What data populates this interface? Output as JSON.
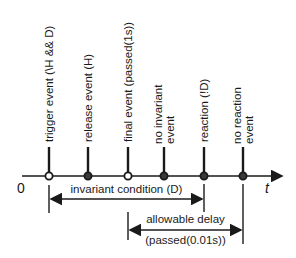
{
  "diagram": {
    "axis": {
      "origin_label": "0",
      "end_label": "t"
    },
    "events": [
      {
        "label_lines": [
          "trigger event (\\H && D)"
        ],
        "x": 49,
        "marker": "hollow"
      },
      {
        "label_lines": [
          "release event (H)"
        ],
        "x": 88,
        "marker": "filled"
      },
      {
        "label_lines": [
          "final event (passed(1s))"
        ],
        "x": 128,
        "marker": "hollow"
      },
      {
        "label_lines": [
          "no invariant",
          "event"
        ],
        "x": 164,
        "marker": "filled"
      },
      {
        "label_lines": [
          "reaction (!D)"
        ],
        "x": 204,
        "marker": "filled"
      },
      {
        "label_lines": [
          "no reaction",
          "event"
        ],
        "x": 243,
        "marker": "filled"
      }
    ],
    "spans": [
      {
        "label": "invariant condition (D)",
        "from_x": 49,
        "to_x": 204
      },
      {
        "label": "allowable delay",
        "sublabel": "(passed(0.01s))",
        "from_x": 128,
        "to_x": 243
      }
    ],
    "colors": {
      "line": "#1a1a1a",
      "background": "#ffffff"
    }
  }
}
